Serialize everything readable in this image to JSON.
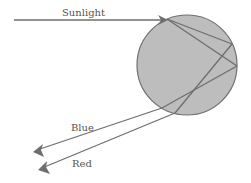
{
  "diagram": {
    "labels": {
      "sunlight": "Sunlight",
      "blue": "Blue",
      "red": "Red"
    },
    "colors": {
      "droplet_fill": "#bdbdbd",
      "droplet_stroke": "#707070",
      "ray": "#6e6e6e",
      "text": "#555555"
    },
    "droplet": {
      "cx": 187,
      "cy": 65,
      "r": 50
    }
  }
}
